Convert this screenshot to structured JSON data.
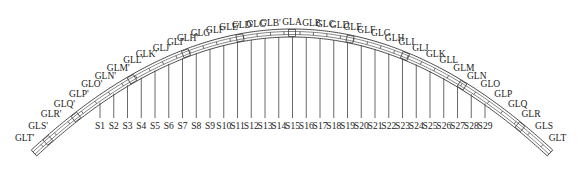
{
  "diagram": {
    "type": "arch-bridge-hangers",
    "arch_labels_left": [
      "GLT'",
      "GLS'",
      "GLR'",
      "GLQ'",
      "GLP'",
      "GLO'",
      "GLN'",
      "GLM'",
      "GLL'",
      "GLK'",
      "GLJ'",
      "GLI'",
      "GLH'",
      "GLG'",
      "GLF'",
      "GLE'",
      "GLD'",
      "GLC'",
      "GLB'"
    ],
    "arch_label_crown": "GLA",
    "arch_labels_right": [
      "GLB",
      "GLC",
      "GLD",
      "GLE",
      "GLF",
      "GLG",
      "GLH",
      "GLI",
      "GLJ",
      "GLK",
      "GLL",
      "GLM",
      "GLN",
      "GLO",
      "GLP",
      "GLQ",
      "GLR",
      "GLS",
      "GLT"
    ],
    "hangers": [
      "S1",
      "S2",
      "S3",
      "S4",
      "S5",
      "S6",
      "S7",
      "S8",
      "S9",
      "S10",
      "S11",
      "S12",
      "S13",
      "S14",
      "S15",
      "S16",
      "S17",
      "S18",
      "S19",
      "S20",
      "S21",
      "S22",
      "S23",
      "S24",
      "S25",
      "S26",
      "S27",
      "S28",
      "S29"
    ],
    "colors": {
      "line": "#333333",
      "text": "#222222",
      "background": "#ffffff"
    }
  }
}
